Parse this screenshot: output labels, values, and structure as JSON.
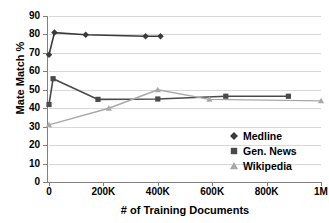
{
  "chart_data": {
    "type": "line",
    "title": "",
    "xlabel": "# of Training Documents",
    "ylabel": "Mate Match %",
    "xlim": [
      0,
      1000000
    ],
    "ylim": [
      0,
      90
    ],
    "grid": true,
    "legend_position": "center-right",
    "x_ticks": [
      {
        "value": 0,
        "label": "0"
      },
      {
        "value": 200000,
        "label": "200K"
      },
      {
        "value": 400000,
        "label": "400K"
      },
      {
        "value": 600000,
        "label": "600K"
      },
      {
        "value": 800000,
        "label": "800K"
      },
      {
        "value": 1000000,
        "label": "1M"
      }
    ],
    "y_ticks": [
      {
        "value": 0,
        "label": "0"
      },
      {
        "value": 10,
        "label": "10"
      },
      {
        "value": 20,
        "label": "20"
      },
      {
        "value": 30,
        "label": "30"
      },
      {
        "value": 40,
        "label": "40"
      },
      {
        "value": 50,
        "label": "50"
      },
      {
        "value": 60,
        "label": "60"
      },
      {
        "value": 70,
        "label": "70"
      },
      {
        "value": 80,
        "label": "80"
      },
      {
        "value": 90,
        "label": "90"
      }
    ],
    "series": [
      {
        "name": "Medline",
        "marker": "diamond",
        "color": "#3a3a3a",
        "x": [
          0,
          20000,
          135000,
          355000,
          410000
        ],
        "values": [
          69,
          81,
          79.8,
          79,
          79
        ]
      },
      {
        "name": "Gen. News",
        "marker": "square",
        "color": "#4a4a4a",
        "x": [
          0,
          15000,
          180000,
          400000,
          650000,
          880000
        ],
        "values": [
          42,
          56,
          44.8,
          45,
          46.5,
          46.5
        ]
      },
      {
        "name": "Wikipedia",
        "marker": "triangle",
        "color": "#a8a8a8",
        "x": [
          0,
          220000,
          400000,
          590000,
          1000000
        ],
        "values": [
          31,
          40,
          50,
          44.8,
          44
        ]
      }
    ]
  },
  "legend": {
    "items": [
      {
        "label": "Medline"
      },
      {
        "label": "Gen. News"
      },
      {
        "label": "Wikipedia"
      }
    ]
  }
}
